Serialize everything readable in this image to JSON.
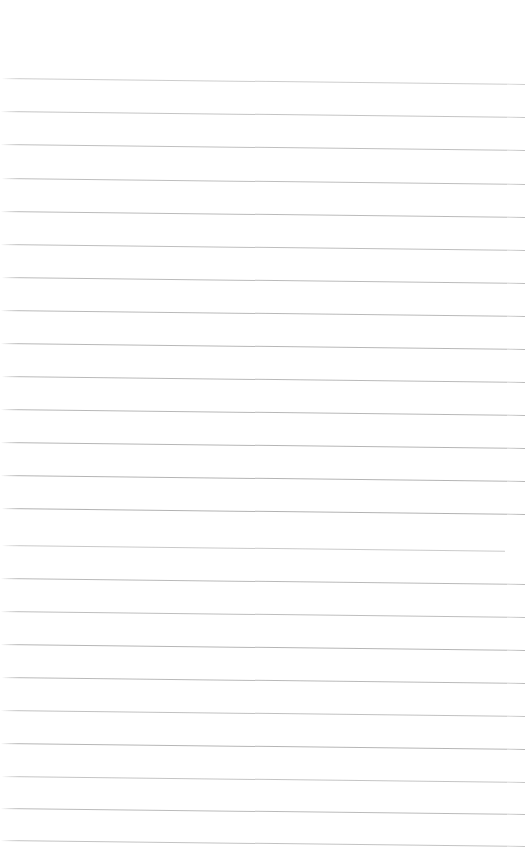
{
  "document": {
    "kind": "scanned-ruled-paper",
    "title": "Blank Ruled Notebook Page",
    "width_px": 525,
    "height_px": 864,
    "background_color": "#ffffff",
    "has_text_content": false,
    "written_content": "",
    "page_number_text": "",
    "header_text": "",
    "footer_text": ""
  },
  "ruling": {
    "line_color": "#aeaeae",
    "line_thickness_px": 1,
    "line_count": 24,
    "first_line_y": 78,
    "last_line_y": 840,
    "line_spacing_px": 33.1,
    "skew_degrees": 0.65,
    "top_margin_px": 78,
    "bottom_margin_px": 24,
    "left_start_x": 2,
    "right_end_x": 525
  },
  "lines": [
    {
      "index": 1,
      "y": 78,
      "x_start": 2,
      "x_end": 525,
      "opacity": 0.62
    },
    {
      "index": 2,
      "y": 111,
      "x_start": 1,
      "x_end": 525,
      "opacity": 0.72
    },
    {
      "index": 3,
      "y": 144,
      "x_start": 1,
      "x_end": 525,
      "opacity": 0.78
    },
    {
      "index": 4,
      "y": 178,
      "x_start": 2,
      "x_end": 525,
      "opacity": 0.8
    },
    {
      "index": 5,
      "y": 211,
      "x_start": 1,
      "x_end": 525,
      "opacity": 0.84
    },
    {
      "index": 6,
      "y": 244,
      "x_start": 1,
      "x_end": 525,
      "opacity": 0.8
    },
    {
      "index": 7,
      "y": 277,
      "x_start": 2,
      "x_end": 525,
      "opacity": 0.84
    },
    {
      "index": 8,
      "y": 310,
      "x_start": 1,
      "x_end": 525,
      "opacity": 0.86
    },
    {
      "index": 9,
      "y": 343,
      "x_start": 1,
      "x_end": 525,
      "opacity": 0.88
    },
    {
      "index": 10,
      "y": 376,
      "x_start": 2,
      "x_end": 525,
      "opacity": 0.86
    },
    {
      "index": 11,
      "y": 409,
      "x_start": 1,
      "x_end": 525,
      "opacity": 0.88
    },
    {
      "index": 12,
      "y": 442,
      "x_start": 1,
      "x_end": 525,
      "opacity": 0.9
    },
    {
      "index": 13,
      "y": 475,
      "x_start": 1,
      "x_end": 525,
      "opacity": 0.92
    },
    {
      "index": 14,
      "y": 508,
      "x_start": 2,
      "x_end": 525,
      "opacity": 0.94
    },
    {
      "index": 15,
      "y": 545,
      "x_start": 2,
      "x_end": 505,
      "opacity": 0.66
    },
    {
      "index": 16,
      "y": 578,
      "x_start": 1,
      "x_end": 525,
      "opacity": 0.86
    },
    {
      "index": 17,
      "y": 611,
      "x_start": 1,
      "x_end": 525,
      "opacity": 0.8
    },
    {
      "index": 18,
      "y": 644,
      "x_start": 1,
      "x_end": 525,
      "opacity": 0.9
    },
    {
      "index": 19,
      "y": 677,
      "x_start": 2,
      "x_end": 525,
      "opacity": 0.86
    },
    {
      "index": 20,
      "y": 710,
      "x_start": 1,
      "x_end": 525,
      "opacity": 0.76
    },
    {
      "index": 21,
      "y": 743,
      "x_start": 1,
      "x_end": 525,
      "opacity": 0.9
    },
    {
      "index": 22,
      "y": 776,
      "x_start": 2,
      "x_end": 525,
      "opacity": 0.72
    },
    {
      "index": 23,
      "y": 808,
      "x_start": 1,
      "x_end": 525,
      "opacity": 0.84
    },
    {
      "index": 24,
      "y": 840,
      "x_start": 1,
      "x_end": 525,
      "opacity": 0.74
    }
  ]
}
